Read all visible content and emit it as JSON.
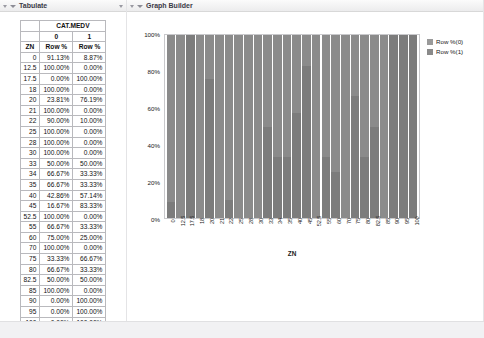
{
  "window": {
    "bottom_strip": ""
  },
  "tabulate": {
    "title": "Tabulate",
    "disclosure_icon": "triangle-down-icon",
    "table": {
      "span_header": "CAT.MEDV",
      "column_levels": [
        "0",
        "1"
      ],
      "row_var_header": "ZN",
      "stat_headers": [
        "Row %",
        "Row %"
      ],
      "rows": [
        {
          "zn": "0",
          "p0": "91.13%",
          "p1": "8.87%"
        },
        {
          "zn": "12.5",
          "p0": "100.00%",
          "p1": "0.00%"
        },
        {
          "zn": "17.5",
          "p0": "0.00%",
          "p1": "100.00%"
        },
        {
          "zn": "18",
          "p0": "100.00%",
          "p1": "0.00%"
        },
        {
          "zn": "20",
          "p0": "23.81%",
          "p1": "76.19%"
        },
        {
          "zn": "21",
          "p0": "100.00%",
          "p1": "0.00%"
        },
        {
          "zn": "22",
          "p0": "90.00%",
          "p1": "10.00%"
        },
        {
          "zn": "25",
          "p0": "100.00%",
          "p1": "0.00%"
        },
        {
          "zn": "28",
          "p0": "100.00%",
          "p1": "0.00%"
        },
        {
          "zn": "30",
          "p0": "100.00%",
          "p1": "0.00%"
        },
        {
          "zn": "33",
          "p0": "50.00%",
          "p1": "50.00%"
        },
        {
          "zn": "34",
          "p0": "66.67%",
          "p1": "33.33%"
        },
        {
          "zn": "35",
          "p0": "66.67%",
          "p1": "33.33%"
        },
        {
          "zn": "40",
          "p0": "42.86%",
          "p1": "57.14%"
        },
        {
          "zn": "45",
          "p0": "16.67%",
          "p1": "83.33%"
        },
        {
          "zn": "52.5",
          "p0": "100.00%",
          "p1": "0.00%"
        },
        {
          "zn": "55",
          "p0": "66.67%",
          "p1": "33.33%"
        },
        {
          "zn": "60",
          "p0": "75.00%",
          "p1": "25.00%"
        },
        {
          "zn": "70",
          "p0": "100.00%",
          "p1": "0.00%"
        },
        {
          "zn": "75",
          "p0": "33.33%",
          "p1": "66.67%"
        },
        {
          "zn": "80",
          "p0": "66.67%",
          "p1": "33.33%"
        },
        {
          "zn": "82.5",
          "p0": "50.00%",
          "p1": "50.00%"
        },
        {
          "zn": "85",
          "p0": "100.00%",
          "p1": "0.00%"
        },
        {
          "zn": "90",
          "p0": "0.00%",
          "p1": "100.00%"
        },
        {
          "zn": "95",
          "p0": "0.00%",
          "p1": "100.00%"
        },
        {
          "zn": "100",
          "p0": "0.00%",
          "p1": "100.00%"
        }
      ]
    }
  },
  "graph": {
    "title": "Graph Builder",
    "disclosure_icon": "triangle-down-icon",
    "legend": {
      "entries": [
        {
          "label": "Row %(0)",
          "color": "#9a9a9a"
        },
        {
          "label": "Row %(1)",
          "color": "#8a8a8a"
        }
      ]
    }
  },
  "chart_data": {
    "type": "bar",
    "stacked": true,
    "normalized": true,
    "title": "",
    "xlabel": "ZN",
    "ylabel": "",
    "ylim": [
      0,
      100
    ],
    "ytick_labels": [
      "100%",
      "80%",
      "60%",
      "40%",
      "20%",
      "0%"
    ],
    "ytick_values": [
      100,
      80,
      60,
      40,
      20,
      0
    ],
    "grid": false,
    "legend_position": "right",
    "categories": [
      "0",
      "12.5",
      "17.5",
      "18",
      "20",
      "21",
      "22",
      "25",
      "28",
      "30",
      "33",
      "34",
      "35",
      "40",
      "45",
      "52.5",
      "55",
      "60",
      "70",
      "75",
      "80",
      "82.5",
      "85",
      "90",
      "95",
      "100"
    ],
    "series": [
      {
        "name": "Row %(0)",
        "color": "#8b8b8b",
        "values": [
          91.13,
          100.0,
          0.0,
          100.0,
          23.81,
          100.0,
          90.0,
          100.0,
          100.0,
          100.0,
          50.0,
          66.67,
          66.67,
          42.86,
          16.67,
          100.0,
          66.67,
          75.0,
          100.0,
          33.33,
          66.67,
          50.0,
          100.0,
          0.0,
          0.0,
          0.0
        ]
      },
      {
        "name": "Row %(1)",
        "color": "#7c7c7c",
        "values": [
          8.87,
          0.0,
          100.0,
          0.0,
          76.19,
          0.0,
          10.0,
          0.0,
          0.0,
          0.0,
          50.0,
          33.33,
          33.33,
          57.14,
          83.33,
          0.0,
          33.33,
          25.0,
          0.0,
          66.67,
          33.33,
          50.0,
          0.0,
          100.0,
          100.0,
          100.0
        ]
      }
    ]
  }
}
